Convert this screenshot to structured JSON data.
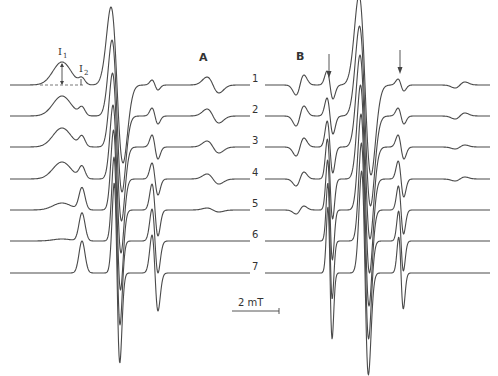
{
  "figure": {
    "panel_a_label": "A",
    "panel_b_label": "B",
    "annotation_i1": "I",
    "annotation_i1_sub": "1",
    "annotation_i2": "I",
    "annotation_i2_sub": "2",
    "scale_bar_label": "2 mT",
    "trace_labels": [
      "1",
      "2",
      "3",
      "4",
      "5",
      "6",
      "7"
    ]
  },
  "chart_data": [
    {
      "type": "line",
      "title": "A",
      "xlabel": "Magnetic field (scale bar 2 mT)",
      "ylabel": "EPR signal (first derivative)",
      "grid": false,
      "series_labels": [
        "1",
        "2",
        "3",
        "4",
        "5",
        "6",
        "7"
      ],
      "x_range_px": [
        10,
        250
      ],
      "baselines_px": [
        85,
        116,
        147,
        179,
        210,
        241,
        273
      ],
      "series": [
        {
          "name": "1",
          "components": [
            [
              62,
              9,
              23
            ],
            [
              82,
              3,
              6
            ],
            [
              117,
              6,
              -78
            ],
            [
              155,
              3,
              -5
            ],
            [
              213,
              6,
              -8
            ]
          ],
          "note": "broad immobilized spectrum"
        },
        {
          "name": "2",
          "components": [
            [
              62,
              9,
              20
            ],
            [
              82,
              3,
              8
            ],
            [
              117,
              5,
              -76
            ],
            [
              155,
              3,
              -8
            ],
            [
              213,
              6,
              -7
            ]
          ]
        },
        {
          "name": "3",
          "components": [
            [
              62,
              9,
              19
            ],
            [
              82,
              3,
              10
            ],
            [
              117,
              4.5,
              -74
            ],
            [
              155,
              3,
              -12
            ],
            [
              213,
              6,
              -6
            ]
          ]
        },
        {
          "name": "4",
          "components": [
            [
              62,
              9,
              17
            ],
            [
              82,
              3,
              12
            ],
            [
              117,
              4,
              -74
            ],
            [
              155,
              3,
              -16
            ],
            [
              213,
              6,
              -5
            ]
          ]
        },
        {
          "name": "5",
          "components": [
            [
              62,
              9,
              7
            ],
            [
              82,
              3,
              22
            ],
            [
              117,
              3.5,
              -80
            ],
            [
              155,
              3,
              -26
            ],
            [
              213,
              6,
              -2
            ]
          ]
        },
        {
          "name": "6",
          "components": [
            [
              62,
              9,
              2
            ],
            [
              82,
              3,
              28
            ],
            [
              117,
              3,
              -84
            ],
            [
              155,
              3,
              -32
            ]
          ]
        },
        {
          "name": "7",
          "components": [
            [
              82,
              3,
              32
            ],
            [
              117,
              2.8,
              -90
            ],
            [
              155,
              3,
              -38
            ]
          ]
        }
      ]
    },
    {
      "type": "line",
      "title": "B",
      "xlabel": "Magnetic field (scale bar 2 mT)",
      "ylabel": "EPR signal (first derivative)",
      "grid": false,
      "series_labels": [
        "1",
        "2",
        "3",
        "4",
        "5",
        "6",
        "7"
      ],
      "x_range_px": [
        265,
        490
      ],
      "baselines_px": [
        85,
        116,
        147,
        179,
        210,
        241,
        273
      ],
      "arrows_px_x": [
        330,
        401
      ],
      "series": [
        {
          "name": "1",
          "components": [
            [
              300,
              4,
              10
            ],
            [
              330,
              3,
              -14
            ],
            [
              365,
              6,
              -90
            ],
            [
              401,
              3,
              -6
            ],
            [
              460,
              5,
              3
            ]
          ]
        },
        {
          "name": "2",
          "components": [
            [
              300,
              4,
              10
            ],
            [
              330,
              3,
              -18
            ],
            [
              365,
              5.5,
              -90
            ],
            [
              401,
              3,
              -8
            ],
            [
              460,
              5,
              3
            ]
          ]
        },
        {
          "name": "3",
          "components": [
            [
              300,
              4,
              9
            ],
            [
              330,
              2.8,
              -26
            ],
            [
              365,
              5,
              -92
            ],
            [
              401,
              3,
              -12
            ],
            [
              460,
              5,
              2
            ]
          ]
        },
        {
          "name": "4",
          "components": [
            [
              300,
              4,
              7
            ],
            [
              330,
              2.6,
              -40
            ],
            [
              365,
              4.5,
              -94
            ],
            [
              401,
              2.8,
              -18
            ],
            [
              460,
              5,
              2
            ]
          ]
        },
        {
          "name": "5",
          "components": [
            [
              300,
              4,
              4
            ],
            [
              330,
              2.4,
              -50
            ],
            [
              365,
              4,
              -96
            ],
            [
              401,
              2.6,
              -24
            ]
          ]
        },
        {
          "name": "6",
          "components": [
            [
              330,
              2.2,
              -58
            ],
            [
              365,
              3.6,
              -98
            ],
            [
              401,
              2.4,
              -30
            ]
          ]
        },
        {
          "name": "7",
          "components": [
            [
              330,
              2.1,
              -66
            ],
            [
              365,
              3.4,
              -102
            ],
            [
              401,
              2.3,
              -36
            ]
          ]
        }
      ]
    }
  ]
}
